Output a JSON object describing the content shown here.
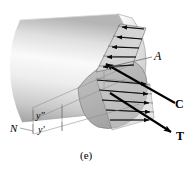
{
  "figure": {
    "caption": "(e)",
    "domain_type": "engineering-mechanics-diagram"
  },
  "labels": {
    "area": "A",
    "compression_force": "C",
    "tension_force": "T",
    "neutral_axis": "N",
    "distance_upper": "y″",
    "distance_lower": "y′"
  },
  "colors": {
    "ink": "#000000",
    "body_light": "#f2f2f2",
    "body_mid": "#cdcdcd",
    "body_dark": "#9a9a9a",
    "section_fill": "#b8b8b8",
    "stress_fill": "#d2d2d2",
    "thin_line": "#8c8c8c",
    "background": "#ffffff"
  },
  "geometry": {
    "width": 194,
    "height": 174,
    "arrow_C": {
      "from": [
        176,
        104
      ],
      "to": [
        103,
        62
      ]
    },
    "arrow_T": {
      "from": [
        112,
        95
      ],
      "to": [
        172,
        133
      ]
    },
    "leader_A": {
      "from": [
        152,
        56
      ],
      "to": [
        108,
        66
      ]
    },
    "leader_N": {
      "from": [
        20,
        128
      ],
      "to": [
        33,
        131
      ]
    }
  }
}
